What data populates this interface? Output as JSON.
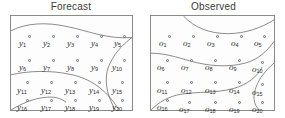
{
  "figure": {
    "background_color": "#ffffff",
    "line_color": "#6e6e6e",
    "box_border_color": "#8a8a8a",
    "text_color": "#2b2b2b"
  },
  "panels": [
    {
      "key": "forecast",
      "title": "Forecast",
      "labels": [
        {
          "id": "y1",
          "text": "y",
          "sub": "1",
          "x": 8,
          "y": 23
        },
        {
          "id": "y2",
          "text": "y",
          "sub": "2",
          "x": 32,
          "y": 23
        },
        {
          "id": "y3",
          "text": "y",
          "sub": "3",
          "x": 56,
          "y": 23
        },
        {
          "id": "y4",
          "text": "y",
          "sub": "4",
          "x": 80,
          "y": 23
        },
        {
          "id": "y5",
          "text": "y",
          "sub": "5",
          "x": 103,
          "y": 23
        },
        {
          "id": "y6",
          "text": "y",
          "sub": "6",
          "x": 8,
          "y": 47
        },
        {
          "id": "y7",
          "text": "y",
          "sub": "7",
          "x": 32,
          "y": 47
        },
        {
          "id": "y8",
          "text": "y",
          "sub": "8",
          "x": 56,
          "y": 47
        },
        {
          "id": "y9",
          "text": "y",
          "sub": "9",
          "x": 80,
          "y": 47
        },
        {
          "id": "y10",
          "text": "y",
          "sub": "10",
          "x": 101,
          "y": 47
        },
        {
          "id": "y11",
          "text": "y",
          "sub": "11",
          "x": 6,
          "y": 70
        },
        {
          "id": "y12",
          "text": "y",
          "sub": "12",
          "x": 30,
          "y": 70
        },
        {
          "id": "y13",
          "text": "y",
          "sub": "13",
          "x": 54,
          "y": 70
        },
        {
          "id": "y14",
          "text": "y",
          "sub": "14",
          "x": 78,
          "y": 70
        },
        {
          "id": "y15",
          "text": "y",
          "sub": "15",
          "x": 101,
          "y": 70
        },
        {
          "id": "y16",
          "text": "y",
          "sub": "16",
          "x": 6,
          "y": 87
        },
        {
          "id": "y17",
          "text": "y",
          "sub": "17",
          "x": 30,
          "y": 87
        },
        {
          "id": "y18",
          "text": "y",
          "sub": "18",
          "x": 54,
          "y": 87
        },
        {
          "id": "y19",
          "text": "y",
          "sub": "19",
          "x": 78,
          "y": 87
        },
        {
          "id": "y20",
          "text": "y",
          "sub": "20",
          "x": 101,
          "y": 87
        }
      ],
      "markers": [
        {
          "x": 17,
          "y": 19
        },
        {
          "x": 41,
          "y": 19
        },
        {
          "x": 65,
          "y": 19
        },
        {
          "x": 89,
          "y": 19
        },
        {
          "x": 112,
          "y": 19
        },
        {
          "x": 17,
          "y": 43
        },
        {
          "x": 41,
          "y": 43
        },
        {
          "x": 65,
          "y": 43
        },
        {
          "x": 89,
          "y": 43
        },
        {
          "x": 112,
          "y": 43
        },
        {
          "x": 15,
          "y": 65
        },
        {
          "x": 39,
          "y": 65
        },
        {
          "x": 63,
          "y": 65
        },
        {
          "x": 87,
          "y": 65
        },
        {
          "x": 110,
          "y": 65
        },
        {
          "x": 15,
          "y": 83
        },
        {
          "x": 39,
          "y": 83
        },
        {
          "x": 63,
          "y": 83
        },
        {
          "x": 87,
          "y": 83
        },
        {
          "x": 110,
          "y": 83
        }
      ],
      "contours": [
        "M0,15 C16,7 36,6 58,11 C78,15 98,24 123,22",
        "M123,22 C112,30 104,40 99,52 C95,64 96,78 106,96",
        "M0,60 C18,56 40,55 62,60 C80,64 96,74 110,96",
        "M0,96 C10,90 22,84 36,83 C46,82 52,85 56,88"
      ]
    },
    {
      "key": "observed",
      "title": "Observed",
      "labels": [
        {
          "id": "o1",
          "text": "o",
          "sub": "1",
          "x": 8,
          "y": 23
        },
        {
          "id": "o2",
          "text": "o",
          "sub": "2",
          "x": 32,
          "y": 23
        },
        {
          "id": "o3",
          "text": "o",
          "sub": "3",
          "x": 56,
          "y": 23
        },
        {
          "id": "o4",
          "text": "o",
          "sub": "4",
          "x": 80,
          "y": 23
        },
        {
          "id": "o5",
          "text": "o",
          "sub": "5",
          "x": 103,
          "y": 23
        },
        {
          "id": "o6",
          "text": "o",
          "sub": "6",
          "x": 6,
          "y": 47
        },
        {
          "id": "o7",
          "text": "o",
          "sub": "7",
          "x": 30,
          "y": 47
        },
        {
          "id": "o8",
          "text": "o",
          "sub": "8",
          "x": 54,
          "y": 47
        },
        {
          "id": "o9",
          "text": "o",
          "sub": "9",
          "x": 78,
          "y": 47
        },
        {
          "id": "o10",
          "text": "o",
          "sub": "10",
          "x": 101,
          "y": 49
        },
        {
          "id": "o11",
          "text": "o",
          "sub": "11",
          "x": 6,
          "y": 70
        },
        {
          "id": "o12",
          "text": "o",
          "sub": "12",
          "x": 30,
          "y": 70
        },
        {
          "id": "o13",
          "text": "o",
          "sub": "13",
          "x": 54,
          "y": 70
        },
        {
          "id": "o14",
          "text": "o",
          "sub": "14",
          "x": 78,
          "y": 70
        },
        {
          "id": "o15",
          "text": "o",
          "sub": "15",
          "x": 101,
          "y": 72
        },
        {
          "id": "o16",
          "text": "o",
          "sub": "16",
          "x": 6,
          "y": 87
        },
        {
          "id": "o17",
          "text": "o",
          "sub": "17",
          "x": 28,
          "y": 89
        },
        {
          "id": "o18",
          "text": "o",
          "sub": "18",
          "x": 54,
          "y": 89
        },
        {
          "id": "o19",
          "text": "o",
          "sub": "19",
          "x": 78,
          "y": 89
        },
        {
          "id": "o20",
          "text": "o",
          "sub": "20",
          "x": 101,
          "y": 89
        }
      ],
      "markers": [
        {
          "x": 17,
          "y": 19
        },
        {
          "x": 41,
          "y": 19
        },
        {
          "x": 65,
          "y": 19
        },
        {
          "x": 89,
          "y": 19
        },
        {
          "x": 112,
          "y": 19
        },
        {
          "x": 15,
          "y": 43
        },
        {
          "x": 39,
          "y": 43
        },
        {
          "x": 63,
          "y": 43
        },
        {
          "x": 87,
          "y": 43
        },
        {
          "x": 110,
          "y": 45
        },
        {
          "x": 15,
          "y": 65
        },
        {
          "x": 39,
          "y": 65
        },
        {
          "x": 63,
          "y": 65
        },
        {
          "x": 87,
          "y": 65
        },
        {
          "x": 110,
          "y": 67
        },
        {
          "x": 15,
          "y": 83
        },
        {
          "x": 37,
          "y": 85
        },
        {
          "x": 63,
          "y": 85
        },
        {
          "x": 87,
          "y": 85
        },
        {
          "x": 110,
          "y": 85
        }
      ],
      "contours": [
        "M33,0 C44,12 60,18 78,18 C96,18 112,12 125,4",
        "M0,38 C14,38 26,42 40,46 C58,51 78,53 96,48 C108,45 118,36 125,26",
        "M125,48 C116,56 110,64 107,72 C103,82 104,90 110,96",
        "M0,96 C8,88 18,82 30,80 C48,77 66,79 84,74 C98,70 108,62 113,52"
      ]
    }
  ],
  "chart_data": {
    "type": "scatter",
    "title": "",
    "subtitle": "",
    "xlabel": "",
    "ylabel": "",
    "grid": false,
    "legend_position": "none",
    "panels": [
      {
        "name": "Forecast",
        "point_labels": [
          "y1",
          "y2",
          "y3",
          "y4",
          "y5",
          "y6",
          "y7",
          "y8",
          "y9",
          "y10",
          "y11",
          "y12",
          "y13",
          "y14",
          "y15",
          "y16",
          "y17",
          "y18",
          "y19",
          "y20"
        ],
        "grid_rows": 4,
        "grid_cols": 5,
        "contour_count": 4
      },
      {
        "name": "Observed",
        "point_labels": [
          "o1",
          "o2",
          "o3",
          "o4",
          "o5",
          "o6",
          "o7",
          "o8",
          "o9",
          "o10",
          "o11",
          "o12",
          "o13",
          "o14",
          "o15",
          "o16",
          "o17",
          "o18",
          "o19",
          "o20"
        ],
        "grid_rows": 4,
        "grid_cols": 5,
        "contour_count": 4
      }
    ]
  }
}
